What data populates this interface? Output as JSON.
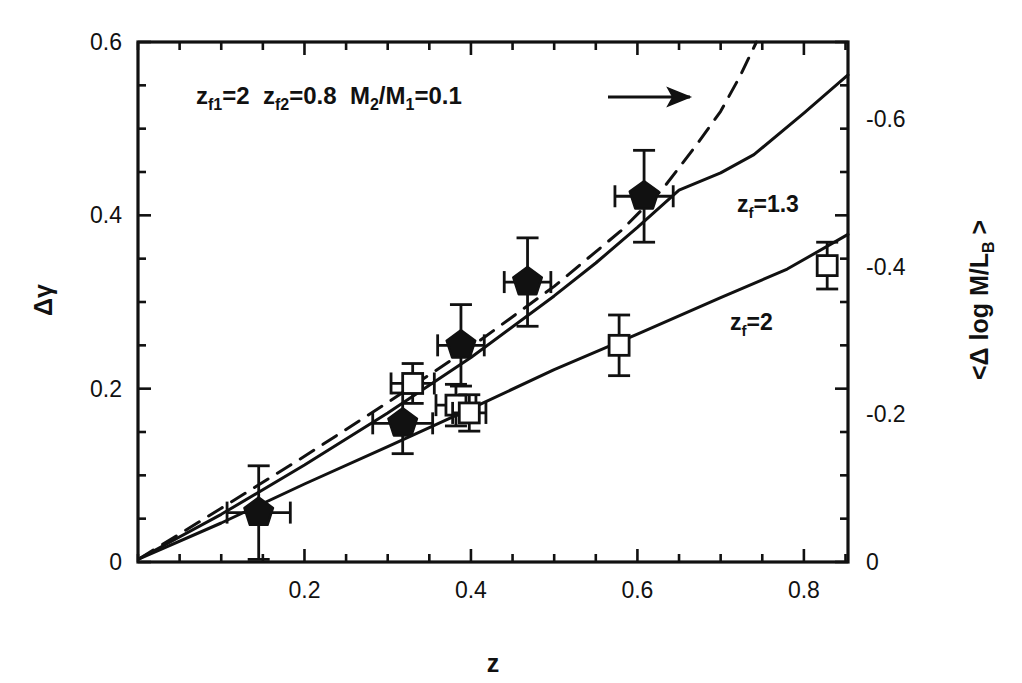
{
  "chart_data": {
    "type": "scatter",
    "title": "",
    "xlabel": "z",
    "ylabel": "Δγ",
    "ylabel_right": "<Δ log M/L_B >",
    "xlim": [
      0.0,
      0.853
    ],
    "ylim": [
      0.0,
      0.6
    ],
    "ylim_right": [
      0.0,
      -0.705
    ],
    "grid": false,
    "legend_position": "inline-annotations",
    "x_ticks": [
      0.2,
      0.4,
      0.6,
      0.8
    ],
    "x_tick_labels": [
      "0.2",
      "0.4",
      "0.6",
      "0.8"
    ],
    "x_minor_step": 0.05,
    "y_ticks_left": [
      0,
      0.2,
      0.4,
      0.6
    ],
    "y_tick_labels_left": [
      "0",
      "0.2",
      "0.4",
      "0.6"
    ],
    "y_minor_step": 0.05,
    "y_ticks_right": [
      0,
      -0.2,
      -0.4,
      -0.6
    ],
    "y_tick_labels_right": [
      "0",
      "-0.2",
      "-0.4",
      "-0.6"
    ],
    "series": [
      {
        "name": "filled-pentagons",
        "marker": "pentagon-filled",
        "points": [
          {
            "x": 0.145,
            "y": 0.057,
            "xerr": 0.038,
            "yerr": 0.054
          },
          {
            "x": 0.318,
            "y": 0.16,
            "xerr": 0.036,
            "yerr": 0.035
          },
          {
            "x": 0.388,
            "y": 0.25,
            "xerr": 0.028,
            "yerr": 0.047
          },
          {
            "x": 0.468,
            "y": 0.323,
            "xerr": 0.028,
            "yerr": 0.051
          },
          {
            "x": 0.608,
            "y": 0.422,
            "xerr": 0.035,
            "yerr": 0.053
          }
        ]
      },
      {
        "name": "open-squares",
        "marker": "square-open",
        "points": [
          {
            "x": 0.33,
            "y": 0.206,
            "xerr": 0.026,
            "yerr": 0.023
          },
          {
            "x": 0.382,
            "y": 0.181,
            "xerr": 0.024,
            "yerr": 0.024
          },
          {
            "x": 0.398,
            "y": 0.172,
            "xerr": 0.02,
            "yerr": 0.021
          },
          {
            "x": 0.578,
            "y": 0.25,
            "xerr": 0.0,
            "yerr": 0.035
          },
          {
            "x": 0.828,
            "y": 0.342,
            "xerr": 0.0,
            "yerr": 0.027
          }
        ]
      },
      {
        "name": "model-zf-1.3",
        "style": "solid",
        "label": "z_f=1.3",
        "x": [
          0.002,
          0.1,
          0.2,
          0.3,
          0.4,
          0.5,
          0.55,
          0.6,
          0.65,
          0.7,
          0.74,
          0.8,
          0.853
        ],
        "y": [
          0.004,
          0.055,
          0.112,
          0.172,
          0.236,
          0.307,
          0.345,
          0.386,
          0.429,
          0.449,
          0.47,
          0.518,
          0.562
        ]
      },
      {
        "name": "model-zf-2",
        "style": "solid",
        "label": "z_f=2",
        "x": [
          0.002,
          0.1,
          0.2,
          0.3,
          0.4,
          0.5,
          0.6,
          0.7,
          0.78,
          0.853
        ],
        "y": [
          0.004,
          0.045,
          0.09,
          0.133,
          0.177,
          0.222,
          0.263,
          0.305,
          0.338,
          0.378
        ]
      },
      {
        "name": "model-merger-dashed",
        "style": "dashed",
        "x": [
          0.002,
          0.1,
          0.2,
          0.3,
          0.4,
          0.5,
          0.58,
          0.63,
          0.67,
          0.7,
          0.723,
          0.743
        ],
        "y": [
          0.004,
          0.062,
          0.122,
          0.184,
          0.248,
          0.318,
          0.382,
          0.43,
          0.48,
          0.52,
          0.56,
          0.6
        ]
      }
    ],
    "annotations": [
      {
        "name": "merger-model-annotation",
        "text_parts": [
          {
            "base": "z",
            "sub": "f1",
            "rest": "=2"
          },
          {
            "base": "z",
            "sub": "f2",
            "rest": "=0.8"
          },
          {
            "base": "M",
            "sub": "2",
            "rest": "/"
          },
          {
            "base": "M",
            "sub": "1",
            "rest": "=0.1"
          }
        ],
        "plain_text": "z_f1=2  z_f2=0.8  M_2/M_1=0.1",
        "arrow": true,
        "arrow_direction": "right"
      }
    ]
  },
  "labels": {
    "x_axis": "z",
    "y_axis_left_delta": "Δ",
    "y_axis_left_gamma": "γ",
    "y_axis_right": "<Δ log M/L",
    "y_axis_right_sub": "B",
    "y_axis_right_tail": " >",
    "curve_zf13_base": "z",
    "curve_zf13_sub": "f",
    "curve_zf13_rest": "=1.3",
    "curve_zf2_base": "z",
    "curve_zf2_sub": "f",
    "curve_zf2_rest": "=2",
    "annot_zf1_base": "z",
    "annot_zf1_sub": "f1",
    "annot_zf1_rest": "=2",
    "annot_zf2_base": "z",
    "annot_zf2_sub": "f2",
    "annot_zf2_rest": "=0.8",
    "annot_m2_base": "M",
    "annot_m2_sub": "2",
    "annot_slash": "/",
    "annot_m1_base": "M",
    "annot_m1_sub": "1",
    "annot_m1_rest": "=0.1"
  },
  "colors": {
    "ink": "#111111",
    "background": "#ffffff"
  }
}
